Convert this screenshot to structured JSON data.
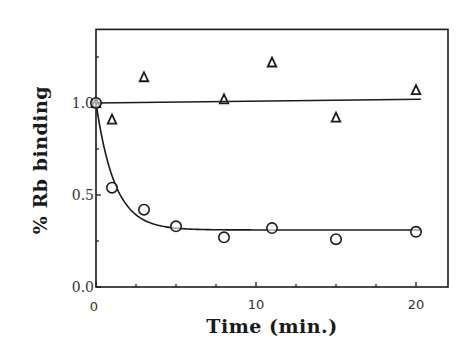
{
  "chart_data": {
    "type": "scatter",
    "title": "",
    "xlabel": "Time  (min.)",
    "ylabel": "%  Rb  binding",
    "xlim": [
      0,
      22
    ],
    "ylim": [
      0,
      1.4
    ],
    "grid": false,
    "legend": null,
    "xticks": [
      0,
      10,
      20
    ],
    "xtick_labels": [
      "0",
      "10",
      "20"
    ],
    "xminor_ticks": [
      2.5,
      5,
      7.5,
      12.5,
      15,
      17.5
    ],
    "yticks": [
      0.0,
      0.5,
      1.0
    ],
    "ytick_labels": [
      "0.0",
      "0.5",
      "1.0"
    ],
    "yminor_ticks": [
      0.25,
      0.75,
      1.25
    ],
    "series": [
      {
        "name": "triangles",
        "marker": "triangle-open",
        "x": [
          0,
          1,
          3,
          8,
          11,
          15,
          20
        ],
        "y": [
          1.0,
          0.91,
          1.14,
          1.02,
          1.22,
          0.92,
          1.07
        ],
        "fit": {
          "type": "linear",
          "x": [
            0,
            20.3
          ],
          "y": [
            1.0,
            1.02
          ]
        }
      },
      {
        "name": "circles",
        "marker": "circle-open",
        "x": [
          0,
          1,
          3,
          5,
          8,
          11,
          15,
          20
        ],
        "y": [
          1.0,
          0.54,
          0.42,
          0.33,
          0.27,
          0.32,
          0.26,
          0.3
        ],
        "fit": {
          "type": "exponential-decay",
          "plateau": 0.31,
          "start": 1.0,
          "k": 0.85,
          "xmax": 20.3
        }
      }
    ]
  }
}
